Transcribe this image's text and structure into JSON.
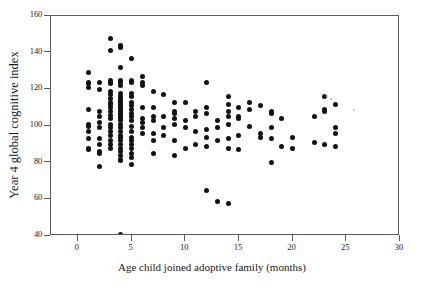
{
  "figure": {
    "background_color": "#ffffff",
    "frame_color": "#5a5a5a",
    "point_color": "#121212"
  },
  "chart_data": {
    "type": "scatter",
    "title": "",
    "xlabel": "Age child joined adoptive family (months)",
    "ylabel": "Year 4 global cognitive index",
    "xlim": [
      -2.5,
      30
    ],
    "ylim": [
      40,
      160
    ],
    "xticks": [
      0,
      5,
      10,
      15,
      20,
      25,
      30
    ],
    "xtick_labels": [
      "0",
      "5",
      "10",
      "15",
      "20",
      "25",
      "30"
    ],
    "yticks": [
      40,
      60,
      80,
      100,
      120,
      140,
      160
    ],
    "ytick_labels": [
      "40",
      "60",
      "80",
      "100",
      "120",
      "140",
      "160"
    ],
    "grid": false,
    "legend": null,
    "marker": "filled-circle",
    "series": [
      {
        "name": "children",
        "n_points": 167,
        "points": [
          [
            1,
            129
          ],
          [
            1,
            124
          ],
          [
            1,
            123
          ],
          [
            1,
            121
          ],
          [
            1,
            109
          ],
          [
            1,
            101
          ],
          [
            1,
            100
          ],
          [
            1,
            97
          ],
          [
            1,
            93
          ],
          [
            1,
            88
          ],
          [
            1,
            87
          ],
          [
            2,
            124
          ],
          [
            2,
            120
          ],
          [
            2,
            108
          ],
          [
            2,
            105
          ],
          [
            2,
            102
          ],
          [
            2,
            99
          ],
          [
            2,
            93
          ],
          [
            2,
            90
          ],
          [
            2,
            86
          ],
          [
            2,
            85
          ],
          [
            2,
            78
          ],
          [
            3,
            148
          ],
          [
            3,
            141
          ],
          [
            3,
            125
          ],
          [
            3,
            124
          ],
          [
            3,
            123
          ],
          [
            3,
            119
          ],
          [
            3,
            117
          ],
          [
            3,
            115
          ],
          [
            3,
            113
          ],
          [
            3,
            112
          ],
          [
            3,
            110
          ],
          [
            3,
            108
          ],
          [
            3,
            106
          ],
          [
            3,
            104
          ],
          [
            3,
            101
          ],
          [
            3,
            99
          ],
          [
            3,
            97
          ],
          [
            3,
            95
          ],
          [
            3,
            92
          ],
          [
            3,
            90
          ],
          [
            3,
            88
          ],
          [
            4,
            144
          ],
          [
            4,
            143
          ],
          [
            4,
            132
          ],
          [
            4,
            125
          ],
          [
            4,
            124
          ],
          [
            4,
            122
          ],
          [
            4,
            118
          ],
          [
            4,
            116
          ],
          [
            4,
            115
          ],
          [
            4,
            114
          ],
          [
            4,
            113
          ],
          [
            4,
            112
          ],
          [
            4,
            111
          ],
          [
            4,
            110
          ],
          [
            4,
            109
          ],
          [
            4,
            108
          ],
          [
            4,
            107
          ],
          [
            4,
            106
          ],
          [
            4,
            105
          ],
          [
            4,
            104
          ],
          [
            4,
            103
          ],
          [
            4,
            101
          ],
          [
            4,
            99
          ],
          [
            4,
            97
          ],
          [
            4,
            95
          ],
          [
            4,
            94
          ],
          [
            4,
            92
          ],
          [
            4,
            90
          ],
          [
            4,
            88
          ],
          [
            4,
            86
          ],
          [
            4,
            84
          ],
          [
            4,
            82
          ],
          [
            4,
            81
          ],
          [
            4,
            41
          ],
          [
            5,
            137
          ],
          [
            5,
            125
          ],
          [
            5,
            124
          ],
          [
            5,
            118
          ],
          [
            5,
            116
          ],
          [
            5,
            113
          ],
          [
            5,
            111
          ],
          [
            5,
            109
          ],
          [
            5,
            107
          ],
          [
            5,
            105
          ],
          [
            5,
            103
          ],
          [
            5,
            100
          ],
          [
            5,
            97
          ],
          [
            5,
            94
          ],
          [
            5,
            92
          ],
          [
            5,
            90
          ],
          [
            5,
            88
          ],
          [
            5,
            85
          ],
          [
            5,
            83
          ],
          [
            5,
            79
          ],
          [
            6,
            127
          ],
          [
            6,
            124
          ],
          [
            6,
            122
          ],
          [
            6,
            110
          ],
          [
            6,
            104
          ],
          [
            6,
            102
          ],
          [
            6,
            99
          ],
          [
            6,
            96
          ],
          [
            7,
            119
          ],
          [
            7,
            110
          ],
          [
            7,
            105
          ],
          [
            7,
            103
          ],
          [
            7,
            96
          ],
          [
            7,
            92
          ],
          [
            7,
            85
          ],
          [
            8,
            117
          ],
          [
            8,
            105
          ],
          [
            8,
            99
          ],
          [
            8,
            95
          ],
          [
            9,
            113
          ],
          [
            9,
            108
          ],
          [
            9,
            107
          ],
          [
            9,
            104
          ],
          [
            9,
            101
          ],
          [
            9,
            92
          ],
          [
            9,
            84
          ],
          [
            10,
            113
          ],
          [
            10,
            103
          ],
          [
            10,
            99
          ],
          [
            10,
            88
          ],
          [
            11,
            108
          ],
          [
            11,
            105
          ],
          [
            11,
            97
          ],
          [
            11,
            90
          ],
          [
            12,
            124
          ],
          [
            12,
            110
          ],
          [
            12,
            107
          ],
          [
            12,
            98
          ],
          [
            12,
            94
          ],
          [
            12,
            89
          ],
          [
            12,
            65
          ],
          [
            13,
            103
          ],
          [
            13,
            99
          ],
          [
            13,
            92
          ],
          [
            13,
            59
          ],
          [
            14,
            116
          ],
          [
            14,
            112
          ],
          [
            14,
            108
          ],
          [
            14,
            105
          ],
          [
            14,
            101
          ],
          [
            14,
            93
          ],
          [
            14,
            88
          ],
          [
            14,
            58
          ],
          [
            15,
            110
          ],
          [
            15,
            105
          ],
          [
            15,
            104
          ],
          [
            15,
            95
          ],
          [
            15,
            87
          ],
          [
            16,
            113
          ],
          [
            16,
            109
          ],
          [
            16,
            100
          ],
          [
            17,
            111
          ],
          [
            17,
            96
          ],
          [
            17,
            94
          ],
          [
            18,
            108
          ],
          [
            18,
            107
          ],
          [
            18,
            99
          ],
          [
            18,
            93
          ],
          [
            18,
            80
          ],
          [
            19,
            104
          ],
          [
            19,
            89
          ],
          [
            20,
            94
          ],
          [
            20,
            88
          ],
          [
            22,
            105
          ],
          [
            22,
            91
          ],
          [
            23,
            116
          ],
          [
            23,
            109
          ],
          [
            23,
            108
          ],
          [
            23,
            90
          ],
          [
            24,
            112
          ],
          [
            24,
            99
          ],
          [
            24,
            96
          ],
          [
            24,
            89
          ]
        ]
      }
    ]
  }
}
